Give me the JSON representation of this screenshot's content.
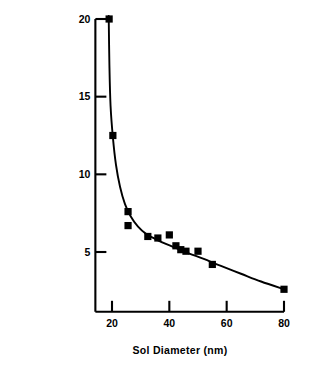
{
  "chart_data": {
    "type": "scatter",
    "title": "",
    "xlabel": "Sol Diameter (nm)",
    "ylabel": "Vol. Citrate (ml)",
    "xlim": [
      14,
      80
    ],
    "ylim": [
      1.1,
      20
    ],
    "xticks": [
      20,
      40,
      60,
      80
    ],
    "yticks": [
      5,
      10,
      15,
      20
    ],
    "xtick_labels": [
      "20",
      "40",
      "60",
      "80"
    ],
    "ytick_labels": [
      "5",
      "10",
      "15",
      "20"
    ],
    "grid": false,
    "legend": null,
    "marker": "filled-square",
    "marker_color": "#000000",
    "line_color": "#000000",
    "series": [
      {
        "name": "Volume of citrate vs. sol diameter",
        "marker": "filled-square",
        "points": [
          {
            "x": 19.0,
            "y": 20.0
          },
          {
            "x": 20.3,
            "y": 12.5
          },
          {
            "x": 25.6,
            "y": 7.6
          },
          {
            "x": 25.6,
            "y": 6.7
          },
          {
            "x": 32.5,
            "y": 6.0
          },
          {
            "x": 36.0,
            "y": 5.9
          },
          {
            "x": 40.0,
            "y": 6.1
          },
          {
            "x": 42.3,
            "y": 5.4
          },
          {
            "x": 44.0,
            "y": 5.15
          },
          {
            "x": 45.8,
            "y": 5.05
          },
          {
            "x": 50.0,
            "y": 5.05
          },
          {
            "x": 55.0,
            "y": 4.2
          },
          {
            "x": 80.0,
            "y": 2.6
          }
        ]
      }
    ],
    "fit_curve": {
      "name": "smooth hyperbolic trend line",
      "points": [
        {
          "x": 18.85,
          "y": 20.2
        },
        {
          "x": 19.1,
          "y": 17.0
        },
        {
          "x": 19.5,
          "y": 14.4
        },
        {
          "x": 20.3,
          "y": 12.4
        },
        {
          "x": 21.4,
          "y": 10.6
        },
        {
          "x": 22.8,
          "y": 9.2
        },
        {
          "x": 24.5,
          "y": 8.1
        },
        {
          "x": 26.5,
          "y": 7.3
        },
        {
          "x": 29.0,
          "y": 6.65
        },
        {
          "x": 32.0,
          "y": 6.15
        },
        {
          "x": 35.5,
          "y": 5.8
        },
        {
          "x": 39.0,
          "y": 5.5
        },
        {
          "x": 43.0,
          "y": 5.2
        },
        {
          "x": 47.0,
          "y": 4.9
        },
        {
          "x": 52.0,
          "y": 4.55
        },
        {
          "x": 58.0,
          "y": 4.1
        },
        {
          "x": 65.0,
          "y": 3.6
        },
        {
          "x": 72.0,
          "y": 3.1
        },
        {
          "x": 80.0,
          "y": 2.6
        }
      ]
    }
  }
}
